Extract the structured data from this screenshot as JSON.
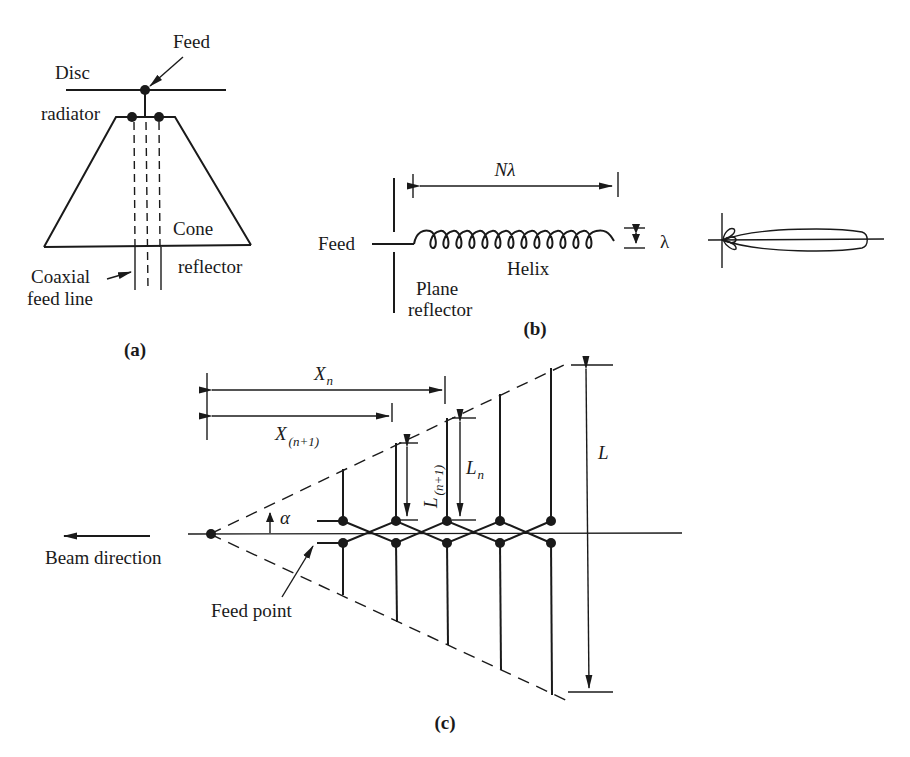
{
  "figure": {
    "panel_a": {
      "caption": "(a)",
      "labels": {
        "feed": "Feed",
        "disc": "Disc",
        "radiator": "radiator",
        "cone": "Cone",
        "reflector": "reflector",
        "coaxial": "Coaxial",
        "feed_line": "feed line"
      }
    },
    "panel_b": {
      "caption": "(b)",
      "labels": {
        "length": "Nλ",
        "feed": "Feed",
        "diameter": "λ",
        "helix": "Helix",
        "plane": "Plane",
        "reflector": "reflector"
      },
      "helix_turns": 14
    },
    "panel_c": {
      "caption": "(c)",
      "labels": {
        "xn_main": "X",
        "xn_sub": "n",
        "xn1_main": "X",
        "xn1_sub": "(n+1)",
        "ln_main": "L",
        "ln_sub": "n",
        "ln1_main": "L",
        "ln1_sub": "(n+1)",
        "L": "L",
        "alpha": "α",
        "beam_direction": "Beam direction",
        "feed_point": "Feed point"
      },
      "element_count": 5
    }
  }
}
